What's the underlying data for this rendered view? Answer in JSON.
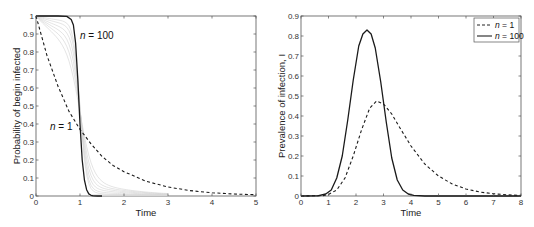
{
  "chart_data": [
    {
      "type": "line",
      "title": "",
      "xlabel": "Time",
      "ylabel": "Probability of begin infected",
      "xlim": [
        0,
        5
      ],
      "ylim": [
        0,
        1
      ],
      "xticks": [
        "0",
        "1",
        "2",
        "3",
        "4",
        "5"
      ],
      "yticks": [
        "0",
        "0.1",
        "0.2",
        "0.3",
        "0.4",
        "0.5",
        "0.6",
        "0.7",
        "0.8",
        "0.9",
        "1"
      ],
      "grid": false,
      "legend": null,
      "annotations": [
        {
          "text_n": "n",
          "text_rest": " = 100",
          "near_x": 1.05,
          "near_y": 0.91
        },
        {
          "text_n": "n",
          "text_rest": " = 1",
          "near_x": 0.35,
          "near_y": 0.4
        }
      ],
      "series": [
        {
          "name": "n = 1",
          "style": "dashed",
          "x": [
            0,
            0.25,
            0.5,
            0.75,
            1.0,
            1.25,
            1.5,
            1.75,
            2.0,
            2.5,
            3.0,
            3.5,
            4.0,
            4.5,
            5.0
          ],
          "y": [
            1.0,
            0.78,
            0.61,
            0.47,
            0.37,
            0.29,
            0.22,
            0.17,
            0.135,
            0.082,
            0.05,
            0.03,
            0.018,
            0.011,
            0.007
          ]
        },
        {
          "name": "n = 100",
          "style": "solid",
          "x": [
            0,
            0.5,
            0.7,
            0.8,
            0.85,
            0.9,
            0.95,
            1.0,
            1.05,
            1.1,
            1.15,
            1.2,
            1.25,
            1.3,
            1.4,
            1.5
          ],
          "y": [
            1.0,
            1.0,
            0.998,
            0.98,
            0.95,
            0.85,
            0.65,
            0.4,
            0.2,
            0.09,
            0.035,
            0.012,
            0.004,
            0.001,
            0.0,
            0.0
          ]
        }
      ],
      "intermediate_curves_note": "faint gray curves between n = 1 and n = 100"
    },
    {
      "type": "line",
      "title": "",
      "xlabel": "Time",
      "ylabel": "Prevalence of infection, I",
      "xlim": [
        0,
        8
      ],
      "ylim": [
        0,
        0.9
      ],
      "xticks": [
        "0",
        "1",
        "2",
        "3",
        "4",
        "5",
        "6",
        "7",
        "8"
      ],
      "yticks": [
        "0",
        "0.1",
        "0.2",
        "0.3",
        "0.4",
        "0.5",
        "0.6",
        "0.7",
        "0.8",
        "0.9"
      ],
      "grid": false,
      "legend": {
        "position": "top-right",
        "entries": [
          {
            "label_n": "n",
            "label_rest": " = 1",
            "style": "dashed"
          },
          {
            "label_n": "n",
            "label_rest": " = 100",
            "style": "solid"
          }
        ]
      },
      "series": [
        {
          "name": "n = 1",
          "style": "dashed",
          "x": [
            0,
            0.8,
            1.0,
            1.3,
            1.6,
            1.9,
            2.2,
            2.5,
            2.75,
            3.0,
            3.3,
            3.6,
            4.0,
            4.5,
            5.0,
            5.5,
            6.0,
            6.5,
            7.0,
            7.5,
            8.0
          ],
          "y": [
            0,
            0.002,
            0.008,
            0.03,
            0.09,
            0.2,
            0.33,
            0.44,
            0.475,
            0.46,
            0.41,
            0.34,
            0.25,
            0.16,
            0.1,
            0.06,
            0.035,
            0.02,
            0.011,
            0.006,
            0.003
          ]
        },
        {
          "name": "n = 100",
          "style": "solid",
          "x": [
            0,
            0.6,
            0.9,
            1.1,
            1.3,
            1.5,
            1.7,
            1.9,
            2.1,
            2.25,
            2.4,
            2.55,
            2.7,
            2.9,
            3.1,
            3.3,
            3.5,
            3.7,
            3.9,
            4.1,
            4.5,
            8.0
          ],
          "y": [
            0,
            0.001,
            0.01,
            0.03,
            0.09,
            0.2,
            0.38,
            0.58,
            0.75,
            0.81,
            0.83,
            0.81,
            0.74,
            0.57,
            0.37,
            0.19,
            0.08,
            0.03,
            0.01,
            0.003,
            0.0,
            0.0
          ]
        }
      ]
    }
  ]
}
